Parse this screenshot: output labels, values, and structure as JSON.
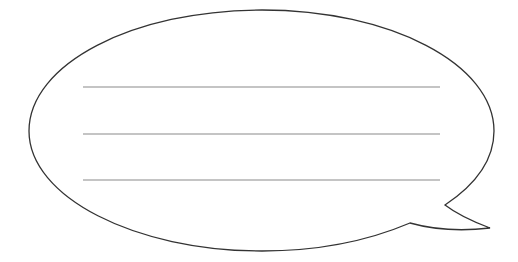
{
  "figure": {
    "type": "speech-bubble",
    "background": "#ffffff",
    "outline_color": "#333333",
    "line_color": "#8a8a8a",
    "writing_lines": [
      {
        "y": 87
      },
      {
        "y": 134
      },
      {
        "y": 180
      }
    ]
  }
}
